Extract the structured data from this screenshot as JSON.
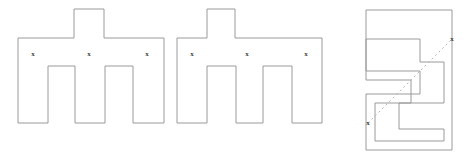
{
  "figure": {
    "canvas": {
      "width": 466,
      "height": 158,
      "background": "#ffffff"
    },
    "style": {
      "outline_color": "#9a9a9a",
      "outline_width": 1,
      "fill_color": "#ffffff",
      "connector_color": "#b6b6b6",
      "connector_dash": "2 3",
      "mark_color": "#3a3a3a",
      "mark_glyph": "x"
    },
    "shapes": [
      {
        "id": "shape-left-comb",
        "name": "left-comb-polygon",
        "description": "Rectilinear comb polygon with one top tab and two bottom notches",
        "points": "18,38 74,38 74,9 104,9 104,38 164,38 164,123 133,123 133,66 105,66 105,123 75,123 75,66 48,66 48,123 18,123",
        "marks": [
          {
            "id": "mark-left-1",
            "x": 33,
            "y": 54,
            "glyph": "x"
          },
          {
            "id": "mark-left-2",
            "x": 89,
            "y": 54,
            "glyph": "x"
          },
          {
            "id": "mark-left-3",
            "x": 147,
            "y": 54,
            "glyph": "x"
          }
        ]
      },
      {
        "id": "shape-middle-comb",
        "name": "middle-comb-polygon",
        "description": "Rectilinear comb polygon with one top tab and two bottom notches",
        "points": "177,38 207,38 207,9 235,9 235,38 322,38 322,123 292,123 292,66 263,66 263,123 236,123 236,66 207,66 207,123 177,123",
        "marks": [
          {
            "id": "mark-mid-1",
            "x": 192,
            "y": 54,
            "glyph": "x"
          },
          {
            "id": "mark-mid-2",
            "x": 247,
            "y": 54,
            "glyph": "x"
          },
          {
            "id": "mark-mid-3",
            "x": 306,
            "y": 54,
            "glyph": "x"
          }
        ]
      },
      {
        "id": "shape-right-zigzag",
        "name": "right-zigzag-polygon",
        "description": "Z-shaped rectilinear spiral polygon with two inward steps",
        "points": "366,10 452,10 452,150 366,150 366,94 420,94 420,71 366,71 366,39 420,39 420,62 444,62 444,103 399,103 399,129 444,129 444,141 375,141 375,103 411,103 411,80 366,80",
        "marks": [
          {
            "id": "mark-right-1",
            "x": 452,
            "y": 39,
            "glyph": "x"
          },
          {
            "id": "mark-right-2",
            "x": 368,
            "y": 123,
            "glyph": "x"
          }
        ]
      }
    ],
    "connectors": [
      {
        "id": "diagonal-connector",
        "name": "dashed-diagonal-connector",
        "from": {
          "x": 368,
          "y": 123
        },
        "to": {
          "x": 452,
          "y": 39
        },
        "dash": "2 3",
        "color": "#b6b6b6"
      }
    ]
  }
}
